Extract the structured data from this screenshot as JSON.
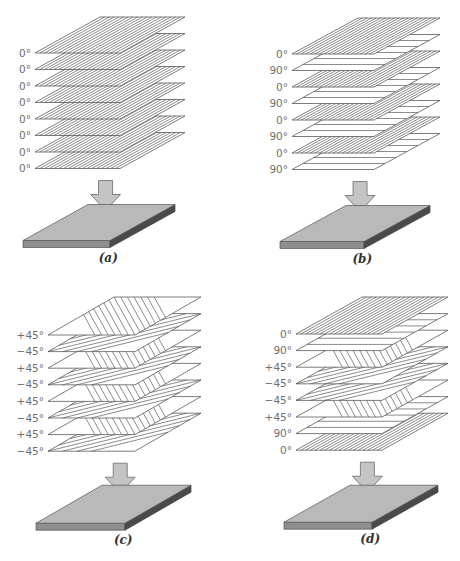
{
  "figure": {
    "panels": [
      {
        "id": "a",
        "caption": "(a)",
        "layup": [
          "0°",
          "0°",
          "0°",
          "0°",
          "0°",
          "0°",
          "0°",
          "0°"
        ],
        "geometry": {
          "x0": 35,
          "y0": 53,
          "w": 85,
          "dx": 65,
          "dy": -36,
          "pitch": 16.5,
          "label_x": 31
        }
      },
      {
        "id": "b",
        "caption": "(b)",
        "layup": [
          "0°",
          "90°",
          "0°",
          "90°",
          "0°",
          "90°",
          "0°",
          "90°"
        ],
        "geometry": {
          "x0": 292,
          "y0": 54,
          "w": 82,
          "dx": 66,
          "dy": -36,
          "pitch": 16.5,
          "label_x": 288
        }
      },
      {
        "id": "c",
        "caption": "(c)",
        "layup": [
          "+45°",
          "−45°",
          "+45°",
          "−45°",
          "+45°",
          "−45°",
          "+45°",
          "−45°"
        ],
        "geometry": {
          "x0": 48,
          "y0": 335,
          "w": 87,
          "dx": 66,
          "dy": -38,
          "pitch": 16.6,
          "label_x": 44
        }
      },
      {
        "id": "d",
        "caption": "(d)",
        "layup": [
          "0°",
          "90°",
          "+45°",
          "−45°",
          "−45°",
          "+45°",
          "90°",
          "0°"
        ],
        "geometry": {
          "x0": 296,
          "y0": 334,
          "w": 86,
          "dx": 66,
          "dy": -37,
          "pitch": 16.6,
          "label_x": 292
        }
      }
    ],
    "colors": {
      "ply_fill": "#ffffff",
      "ply_stroke": "#5a5a5a",
      "arrow_fill": "#c4c4c4",
      "plate_top": "#b9b9b9",
      "plate_front": "#8e8e8e",
      "plate_side": "#4a4a4a",
      "label_text": "#6f6f6f"
    }
  }
}
